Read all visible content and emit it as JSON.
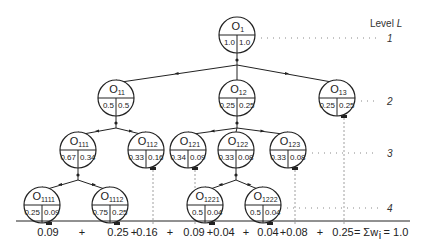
{
  "level_header": {
    "label": "Level",
    "symbol": "L"
  },
  "levels": [
    {
      "label": "1",
      "y": 38
    },
    {
      "label": "2",
      "y": 98
    },
    {
      "label": "3",
      "y": 150
    },
    {
      "label": "4",
      "y": 200
    }
  ],
  "nodes": [
    {
      "id": "O1",
      "base": "O",
      "sub": "1",
      "left": "1.0",
      "right": "1.0",
      "x": 237,
      "y": 35,
      "level": 1
    },
    {
      "id": "O11",
      "base": "O",
      "sub": "11",
      "left": "0.5",
      "right": "0.5",
      "x": 116,
      "y": 98,
      "level": 2
    },
    {
      "id": "O12",
      "base": "O",
      "sub": "12",
      "left": "0.25",
      "right": "0.25",
      "x": 237,
      "y": 98,
      "level": 2
    },
    {
      "id": "O13",
      "base": "O",
      "sub": "13",
      "left": "0.25",
      "right": "0.25",
      "x": 337,
      "y": 98,
      "level": 2
    },
    {
      "id": "O111",
      "base": "O",
      "sub": "111",
      "left": "0.67",
      "right": "0.34",
      "x": 78,
      "y": 150,
      "level": 3
    },
    {
      "id": "O112",
      "base": "O",
      "sub": "112",
      "left": "0.33",
      "right": "0.16",
      "x": 146,
      "y": 150,
      "level": 3
    },
    {
      "id": "O121",
      "base": "O",
      "sub": "121",
      "left": "0.34",
      "right": "0.09",
      "x": 188,
      "y": 150,
      "level": 3
    },
    {
      "id": "O122",
      "base": "O",
      "sub": "122",
      "left": "0.33",
      "right": "0.08",
      "x": 236,
      "y": 150,
      "level": 3
    },
    {
      "id": "O123",
      "base": "O",
      "sub": "123",
      "left": "0.33",
      "right": "0.08",
      "x": 288,
      "y": 150,
      "level": 3
    },
    {
      "id": "O1111",
      "base": "O",
      "sub": "1111",
      "left": "0.25",
      "right": "0.09",
      "x": 42,
      "y": 205,
      "level": 4
    },
    {
      "id": "O1112",
      "base": "O",
      "sub": "1112",
      "left": "0.75",
      "right": "0.25",
      "x": 110,
      "y": 205,
      "level": 4
    },
    {
      "id": "O1221",
      "base": "O",
      "sub": "1221",
      "left": "0.5",
      "right": "0.04",
      "x": 205,
      "y": 205,
      "level": 4
    },
    {
      "id": "O1222",
      "base": "O",
      "sub": "1222",
      "left": "0.5",
      "right": "0.04",
      "x": 263,
      "y": 205,
      "level": 4
    }
  ],
  "edges": [
    [
      "O1",
      "O11"
    ],
    [
      "O1",
      "O12"
    ],
    [
      "O1",
      "O13"
    ],
    [
      "O11",
      "O111"
    ],
    [
      "O11",
      "O112"
    ],
    [
      "O12",
      "O121"
    ],
    [
      "O12",
      "O122"
    ],
    [
      "O12",
      "O123"
    ],
    [
      "O111",
      "O1111"
    ],
    [
      "O111",
      "O1112"
    ],
    [
      "O122",
      "O1221"
    ],
    [
      "O122",
      "O1222"
    ]
  ],
  "leaves": [
    "O1111",
    "O1112",
    "O112",
    "O121",
    "O1221",
    "O1222",
    "O123",
    "O13"
  ],
  "sum_terms": [
    {
      "text": "0.09",
      "x": 48
    },
    {
      "text": "+",
      "x": 82
    },
    {
      "text": "0.25",
      "x": 118
    },
    {
      "text": "+",
      "x": 134
    },
    {
      "text": "0.16",
      "x": 147
    },
    {
      "text": "+",
      "x": 170
    },
    {
      "text": "0.09",
      "x": 194
    },
    {
      "text": "+",
      "x": 210
    },
    {
      "text": "0.04",
      "x": 224
    },
    {
      "text": "+",
      "x": 246
    },
    {
      "text": "0.04",
      "x": 268
    },
    {
      "text": "+",
      "x": 283
    },
    {
      "text": "0.08",
      "x": 297
    },
    {
      "text": "+",
      "x": 320
    },
    {
      "text": "0.25",
      "x": 343
    },
    {
      "text": "= Σw",
      "x": 366
    },
    {
      "text": "i",
      "x": 380
    },
    {
      "text": "= 1.0",
      "x": 396
    }
  ],
  "sum_equation": "0.09 + 0.25 + 0.16 + 0.09 + 0.04 + 0.04 + 0.08 + 0.25 = Σwi = 1.0",
  "colors": {
    "line": "#222222",
    "dotted": "#888888",
    "background": "#ffffff"
  }
}
